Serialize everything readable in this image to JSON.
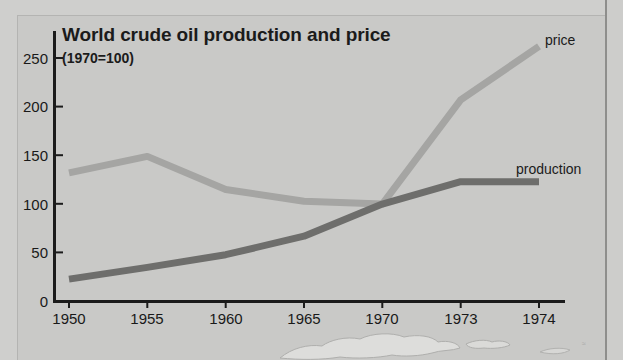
{
  "figure": {
    "background_color": "#c9c9c7",
    "frame_color": "#8e8e8c"
  },
  "chart_data": {
    "type": "line",
    "title": "World crude oil production and price",
    "subtitle": "(1970=100)",
    "xlabel": "",
    "ylabel": "",
    "categories": [
      "1950",
      "1955",
      "1960",
      "1965",
      "1970",
      "1973",
      "1974"
    ],
    "x_tick_labels": [
      "1950",
      "1955",
      "1960",
      "1965",
      "1970",
      "1973",
      "1974"
    ],
    "y_tick_labels": [
      "0",
      "50",
      "100",
      "150",
      "200",
      "250"
    ],
    "y_ticks": [
      0,
      50,
      100,
      150,
      200,
      250
    ],
    "ylim": [
      0,
      272
    ],
    "grid": false,
    "legend_position": "inline-right-of-line-end",
    "series": [
      {
        "name": "price",
        "label": "price",
        "color": "#a5a5a3",
        "line_width": 7,
        "values": [
          132,
          149,
          115,
          103,
          100,
          207,
          262
        ]
      },
      {
        "name": "production",
        "label": "production",
        "color": "#6e6e6c",
        "line_width": 7,
        "values": [
          23,
          35,
          48,
          67,
          100,
          123,
          123
        ]
      }
    ],
    "annotations": [
      {
        "text": "price",
        "attached_to": "price",
        "at_category": "1974"
      },
      {
        "text": "production",
        "attached_to": "production",
        "at_category": "1974"
      }
    ]
  },
  "decoration": {
    "map_caption": "world-map-watermark"
  }
}
